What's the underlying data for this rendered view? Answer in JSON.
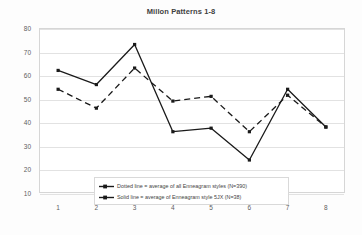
{
  "chart_data": {
    "type": "line",
    "title": "Millon Patterns 1-8",
    "xlabel": "",
    "ylabel": "",
    "x": [
      1,
      2,
      3,
      4,
      5,
      6,
      7,
      8
    ],
    "categories": [
      "1",
      "2",
      "3",
      "4",
      "5",
      "6",
      "7",
      "8"
    ],
    "ylim": [
      10,
      80
    ],
    "yticks": [
      80,
      70,
      60,
      50,
      40,
      30,
      20,
      10
    ],
    "ytick_labels": [
      "80",
      "70",
      "60",
      "50",
      "40",
      "30",
      "20",
      "10"
    ],
    "grid": true,
    "legend_position": "inside-bottom-center",
    "series": [
      {
        "name": "Solid line = average of Enneagram style 5JX (N=38)",
        "style": "solid",
        "color": "#1a1a1a",
        "marker": "square",
        "values": [
          62,
          56,
          73,
          36,
          37.5,
          24,
          54,
          38
        ]
      },
      {
        "name": "Dotted line = average of all Enneagram styles (N=390)",
        "style": "dashed",
        "color": "#1a1a1a",
        "marker": "square",
        "values": [
          54,
          46,
          63,
          49,
          51,
          36,
          51.5,
          38
        ]
      }
    ],
    "legend": [
      "Dotted line = average of all Enneagram styles (N=390)",
      "Solid line = average of Enneagram style 5JX (N=38)"
    ]
  },
  "colors": {
    "line": "#1a1a1a",
    "grid": "#e2e2e2",
    "frame": "#d6d6d6",
    "axis_text": "#5e5e5e",
    "title_text": "#3f3f3f"
  }
}
